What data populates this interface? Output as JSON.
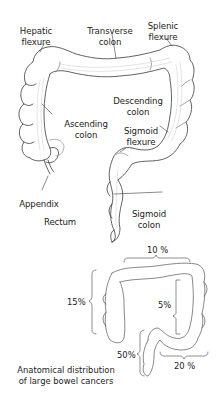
{
  "diagram": {
    "labels": {
      "hepatic_flexure": "Hepatic\nflexure",
      "transverse_colon": "Transverse\ncolon",
      "splenic_flexure": "Splenic\nflexure",
      "ascending_colon": "Ascending\ncolon",
      "descending_colon": "Descending\ncolon",
      "sigmoid_flexure": "Sigmoid\nflexure",
      "appendix": "Appendix",
      "rectum": "Rectum",
      "sigmoid_colon": "Sigmoid\ncolon"
    },
    "distribution": {
      "caption": "Anatomical distribution\nof large bowel cancers",
      "transverse": "10 %",
      "ascending": "15%",
      "descending": "5%",
      "rectum": "50%",
      "sigmoid": "20 %"
    },
    "colors": {
      "line": "#3a3a3a",
      "fill": "#ffffff",
      "shading": "#c8c8c8"
    }
  }
}
